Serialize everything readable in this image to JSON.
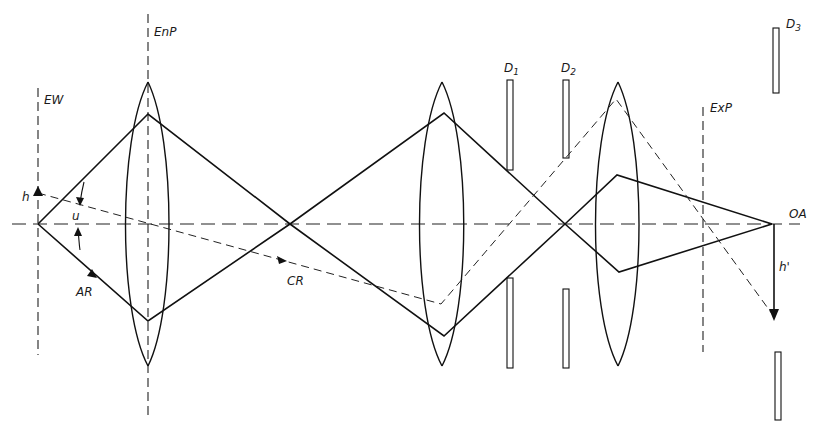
{
  "diagram": {
    "type": "optical-ray-diagram",
    "labels": {
      "entrance_window": "EW",
      "entrance_pupil": "EnP",
      "exit_pupil": "ExP",
      "optical_axis": "OA",
      "aperture_ray": "AR",
      "chief_ray": "CR",
      "object_height": "h",
      "image_height": "h'",
      "aperture_angle": "u",
      "diaphragm_1": {
        "letter": "D",
        "sub": "1"
      },
      "diaphragm_2": {
        "letter": "D",
        "sub": "2"
      },
      "diaphragm_3": {
        "letter": "D",
        "sub": "3"
      }
    },
    "colors": {
      "line": "#111111",
      "background": "#ffffff"
    },
    "elements": {
      "optical_axis_y": 224,
      "object_point": [
        38,
        224
      ],
      "intermediate_image": [
        290,
        224
      ],
      "second_crossing": [
        565,
        224
      ],
      "image_point": [
        772,
        224
      ],
      "lenses": [
        {
          "name": "lens-1",
          "x": 148,
          "top": 82,
          "bottom": 366
        },
        {
          "name": "lens-2",
          "x": 442,
          "top": 82,
          "bottom": 366
        },
        {
          "name": "lens-3",
          "x": 618,
          "top": 82,
          "bottom": 366
        }
      ],
      "diaphragms": [
        {
          "name": "D1",
          "x": 510,
          "upper": [
            80,
            170
          ],
          "lower": [
            278,
            368
          ]
        },
        {
          "name": "D2",
          "x": 566,
          "upper": [
            80,
            158
          ],
          "lower": [
            289,
            368
          ]
        },
        {
          "name": "D3",
          "x": 776,
          "upper": [
            28,
            93
          ],
          "lower": [
            352,
            420
          ]
        }
      ],
      "planes": {
        "EW_x": 38,
        "EnP_x": 148,
        "ExP_x": 703
      }
    }
  }
}
